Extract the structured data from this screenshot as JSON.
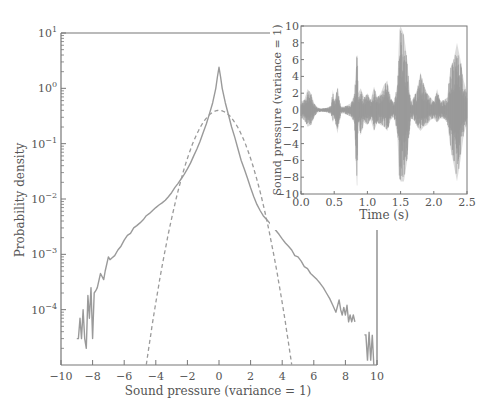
{
  "chart_data": [
    {
      "type": "line",
      "name": "main-probability-density",
      "title": "",
      "xlabel": "Sound pressure (variance = 1)",
      "ylabel": "Probability density",
      "xlim": [
        -10,
        10
      ],
      "ylim": [
        1e-05,
        10
      ],
      "yscale": "log",
      "grid": false,
      "legend": null,
      "xticks": [
        -10,
        -8,
        -6,
        -4,
        -2,
        0,
        2,
        4,
        6,
        8,
        10
      ],
      "xtick_labels": [
        "−10",
        "−8",
        "−6",
        "−4",
        "−2",
        "0",
        "2",
        "4",
        "6",
        "8",
        "10"
      ],
      "yticks": [
        10,
        1,
        0.1,
        0.01,
        0.001,
        0.0001
      ],
      "ytick_labels": [
        {
          "base": "10",
          "exp": "1"
        },
        {
          "base": "10",
          "exp": "0"
        },
        {
          "base": "10",
          "exp": "−1"
        },
        {
          "base": "10",
          "exp": "−2"
        },
        {
          "base": "10",
          "exp": "−3"
        },
        {
          "base": "10",
          "exp": "−4"
        }
      ],
      "series": [
        {
          "name": "Empirical (speech)",
          "style": "solid",
          "color": "#9a9a9a",
          "x": [
            -9.0,
            -8.9,
            -8.8,
            -8.7,
            -8.6,
            -8.5,
            -8.4,
            -8.3,
            -8.2,
            -8.1,
            -8.0,
            -7.9,
            -7.8,
            -7.7,
            -7.5,
            -7.3,
            -7.2,
            -7.0,
            -6.9,
            -6.8,
            -6.6,
            -6.4,
            -6.2,
            -6.0,
            -5.8,
            -5.6,
            -5.4,
            -5.2,
            -5.0,
            -4.8,
            -4.6,
            -4.4,
            -4.2,
            -4.0,
            -3.8,
            -3.6,
            -3.4,
            -3.2,
            -3.0,
            -2.8,
            -2.6,
            -2.4,
            -2.2,
            -2.0,
            -1.8,
            -1.6,
            -1.4,
            -1.2,
            -1.0,
            -0.8,
            -0.6,
            -0.4,
            -0.2,
            -0.1,
            0.0,
            0.1,
            0.2,
            0.4,
            0.6,
            0.8,
            1.0,
            1.2,
            1.4,
            1.6,
            1.8,
            2.0,
            2.2,
            2.4,
            2.6,
            2.8,
            3.0,
            3.2,
            3.4,
            3.6,
            3.8,
            4.0,
            4.2,
            4.4,
            4.6,
            4.8,
            5.0,
            5.2,
            5.4,
            5.6,
            5.8,
            6.0,
            6.2,
            6.4,
            6.6,
            6.8,
            7.0,
            7.2,
            7.4,
            7.6,
            7.7,
            7.8,
            7.9,
            8.0,
            8.1,
            8.2,
            8.3,
            8.4,
            8.5,
            8.6,
            8.7,
            8.8
          ],
          "y": [
            3e-05,
            3e-05,
            7e-05,
            3e-05,
            0.0001,
            3e-05,
            2e-05,
            0.00018,
            7e-05,
            0.00025,
            3e-05,
            0.0002,
            0.00022,
            0.00025,
            0.00045,
            0.00035,
            0.0005,
            0.0009,
            0.0008,
            0.00085,
            0.00095,
            0.0012,
            0.0014,
            0.0018,
            0.0022,
            0.0024,
            0.003,
            0.0033,
            0.0037,
            0.0042,
            0.005,
            0.0055,
            0.0062,
            0.007,
            0.0078,
            0.0085,
            0.0095,
            0.011,
            0.013,
            0.016,
            0.019,
            0.023,
            0.028,
            0.035,
            0.045,
            0.06,
            0.08,
            0.11,
            0.16,
            0.23,
            0.35,
            0.55,
            1.0,
            1.6,
            2.4,
            1.6,
            1.0,
            0.55,
            0.33,
            0.2,
            0.13,
            0.08,
            0.05,
            0.035,
            0.024,
            0.016,
            0.011,
            0.008,
            0.0062,
            0.005,
            0.0043,
            0.0037,
            0.0032,
            0.0027,
            0.0023,
            0.0019,
            0.0016,
            0.0014,
            0.0012,
            0.00095,
            0.0009,
            0.00075,
            0.0006,
            0.00055,
            0.00045,
            0.0004,
            0.00035,
            0.0003,
            0.00025,
            0.0002,
            0.00016,
            0.00012,
            9e-05,
            0.00015,
            0.0001,
            8e-05,
            0.00011,
            8e-05,
            0.00012,
            6e-05,
            8e-05,
            6e-05,
            8e-05,
            6e-05
          ],
          "extra_segment": {
            "x": [
              9.2,
              9.3,
              9.4,
              9.5,
              9.6,
              9.7,
              9.8
            ],
            "y": [
              3.5e-05,
              3.5e-05,
              1.2e-05,
              4e-05,
              1.2e-05,
              3.5e-05,
              1e-05
            ]
          }
        },
        {
          "name": "Gaussian (variance = 1)",
          "style": "dashed",
          "color": "#9a9a9a",
          "formula": "exp(-x^2/2)/sqrt(2*pi)",
          "x_range": [
            -4.6,
            4.6
          ]
        }
      ]
    },
    {
      "type": "line",
      "name": "inset-waveform",
      "title": "",
      "xlabel": "Time (s)",
      "ylabel": "Sound pressure (variance = 1)",
      "xlim": [
        0.0,
        2.5
      ],
      "ylim": [
        -10,
        10
      ],
      "grid": false,
      "xticks": [
        0.0,
        0.5,
        1.0,
        1.5,
        2.0,
        2.5
      ],
      "xtick_labels": [
        "0.0",
        "0.5",
        "1.0",
        "1.5",
        "2.0",
        "2.5"
      ],
      "yticks": [
        10,
        8,
        6,
        4,
        2,
        0,
        -2,
        -4,
        -6,
        -8,
        -10
      ],
      "ytick_labels": [
        "10",
        "8",
        "6",
        "4",
        "2",
        "0",
        "−2",
        "−4",
        "−6",
        "−8",
        "−10"
      ],
      "series": [
        {
          "name": "Speech waveform envelope",
          "color": "#9a9a9a",
          "t": [
            0.0,
            0.05,
            0.1,
            0.15,
            0.2,
            0.25,
            0.3,
            0.35,
            0.4,
            0.45,
            0.48,
            0.5,
            0.55,
            0.6,
            0.65,
            0.7,
            0.75,
            0.8,
            0.84,
            0.85,
            0.86,
            0.9,
            0.95,
            1.0,
            1.05,
            1.1,
            1.15,
            1.2,
            1.25,
            1.3,
            1.35,
            1.4,
            1.45,
            1.48,
            1.5,
            1.55,
            1.6,
            1.65,
            1.7,
            1.75,
            1.8,
            1.85,
            1.9,
            1.95,
            2.0,
            2.05,
            2.1,
            2.15,
            2.2,
            2.25,
            2.3,
            2.35,
            2.4,
            2.45,
            2.5
          ],
          "upper": [
            1.0,
            1.2,
            2.5,
            2.0,
            0.8,
            0.3,
            0.2,
            0.2,
            0.3,
            0.5,
            2.4,
            1.0,
            2.7,
            0.4,
            0.4,
            0.6,
            0.8,
            1.8,
            6.5,
            6.5,
            2.0,
            2.6,
            1.5,
            2.0,
            1.2,
            2.8,
            1.5,
            2.0,
            3.0,
            3.5,
            1.5,
            0.8,
            3.0,
            9.5,
            10.0,
            9.0,
            6.0,
            1.0,
            1.5,
            2.5,
            4.5,
            3.0,
            2.0,
            1.5,
            1.0,
            2.5,
            1.0,
            1.2,
            1.5,
            5.0,
            6.0,
            8.0,
            6.0,
            3.5,
            2.0
          ],
          "lower": [
            -1.0,
            -1.2,
            -2.0,
            -1.8,
            -0.8,
            -0.3,
            -0.2,
            -0.2,
            -0.3,
            -0.5,
            -1.5,
            -0.8,
            -2.8,
            -0.4,
            -0.4,
            -0.6,
            -0.8,
            -1.5,
            -9.0,
            -9.0,
            -1.5,
            -3.0,
            -1.5,
            -1.8,
            -1.2,
            -2.5,
            -1.5,
            -1.8,
            -2.0,
            -2.5,
            -1.2,
            -0.8,
            -3.0,
            -8.0,
            -8.5,
            -8.5,
            -6.0,
            -1.0,
            -1.2,
            -2.0,
            -2.5,
            -2.0,
            -1.8,
            -1.2,
            -1.0,
            -1.5,
            -1.0,
            -1.0,
            -1.5,
            -4.5,
            -6.5,
            -8.5,
            -6.0,
            -3.0,
            -1.5
          ]
        }
      ]
    }
  ],
  "labels": {
    "main_xlabel": "Sound pressure (variance = 1)",
    "main_ylabel": "Probability density",
    "inset_xlabel": "Time (s)",
    "inset_ylabel": "Sound pressure (variance = 1)"
  },
  "colors": {
    "axis": "#777777",
    "curve": "#9a9a9a",
    "text": "#555555"
  }
}
